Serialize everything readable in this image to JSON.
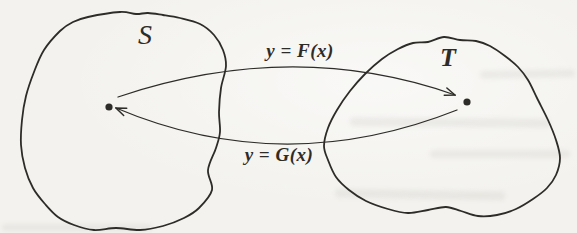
{
  "figure": {
    "type": "set-mapping-diagram",
    "left_set": {
      "label": "S"
    },
    "right_set": {
      "label": "T"
    },
    "forward_map": {
      "label": "y = F(x)",
      "from": "S",
      "to": "T"
    },
    "inverse_map": {
      "label": "y = G(x)",
      "from": "T",
      "to": "S"
    },
    "colors": {
      "ink": "#2e2c29",
      "dot": "#1c1b19",
      "paper": "#f3f2ee"
    }
  }
}
